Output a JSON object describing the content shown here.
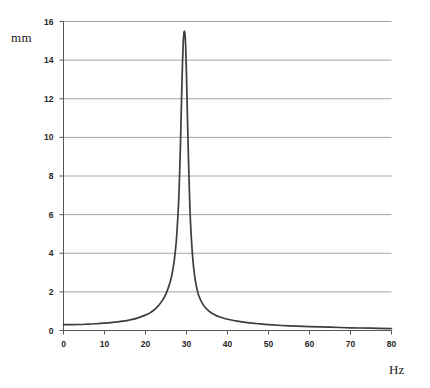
{
  "chart_data": {
    "type": "line",
    "title": "",
    "xlabel": "Hz",
    "ylabel": "mm",
    "xlim": [
      0,
      80
    ],
    "ylim": [
      0,
      16
    ],
    "grid": true,
    "gridlines": "horizontal",
    "legend": null,
    "xticks": [
      0,
      10,
      20,
      30,
      40,
      50,
      60,
      70,
      80
    ],
    "xtick_labels": [
      "0",
      "10",
      "20",
      "30",
      "40",
      "50",
      "60",
      "70",
      "80"
    ],
    "yticks": [
      0,
      2,
      4,
      6,
      8,
      10,
      12,
      14,
      16
    ],
    "ytick_labels": [
      "0",
      "2",
      "4",
      "6",
      "8",
      "10",
      "12",
      "14",
      "16"
    ],
    "series": [
      {
        "name": "amplitude",
        "color": "#3d3d3d",
        "description": "Resonance response curve: flat low baseline rising to a sharp narrow peak near 29.5 Hz then decaying toward zero",
        "peak_x": 29.5,
        "peak_y": 15.5,
        "x": [
          0,
          2,
          4,
          6,
          8,
          10,
          12,
          14,
          16,
          18,
          20,
          21,
          22,
          23,
          24,
          25,
          26,
          26.5,
          27,
          27.5,
          28,
          28.25,
          28.5,
          28.75,
          29,
          29.2,
          29.35,
          29.5,
          29.65,
          29.8,
          30,
          30.25,
          30.5,
          30.75,
          31,
          31.5,
          32,
          32.5,
          33,
          34,
          35,
          36,
          37,
          38,
          40,
          42,
          44,
          46,
          48,
          50,
          55,
          60,
          65,
          70,
          75,
          80
        ],
        "y": [
          0.3,
          0.3,
          0.31,
          0.33,
          0.35,
          0.38,
          0.42,
          0.47,
          0.54,
          0.64,
          0.8,
          0.9,
          1.05,
          1.25,
          1.52,
          1.9,
          2.5,
          2.95,
          3.6,
          4.6,
          6.3,
          7.6,
          9.4,
          11.6,
          13.7,
          14.9,
          15.35,
          15.5,
          15.3,
          14.7,
          13.2,
          10.9,
          8.7,
          6.9,
          5.5,
          3.8,
          2.8,
          2.2,
          1.8,
          1.35,
          1.1,
          0.92,
          0.8,
          0.71,
          0.58,
          0.5,
          0.43,
          0.38,
          0.34,
          0.3,
          0.24,
          0.2,
          0.17,
          0.14,
          0.12,
          0.1
        ]
      }
    ]
  },
  "axes": {
    "y_unit_label": "mm",
    "x_unit_label": "Hz"
  },
  "colors": {
    "curve": "#3d3d3d",
    "grid": "#9a9a9a",
    "axis": "#555555",
    "text": "#262626",
    "background": "#ffffff"
  }
}
